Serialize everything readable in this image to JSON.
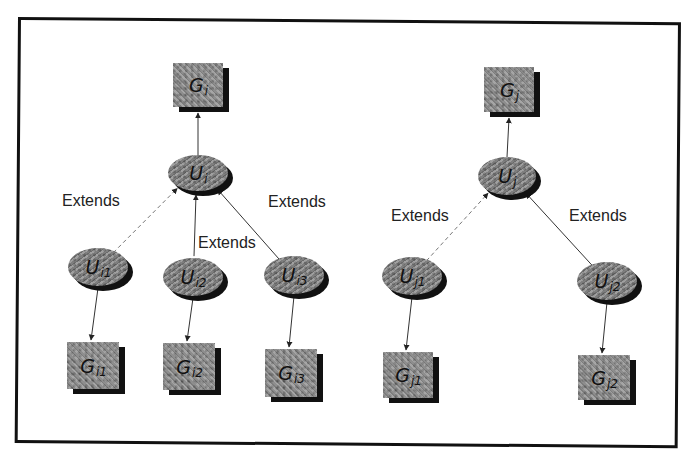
{
  "figure": {
    "frame": {
      "left": 18,
      "top": 17,
      "right": 683,
      "bottom": 446
    }
  },
  "trees": [
    {
      "id": "left",
      "group_root": {
        "label": "G",
        "sub": "i",
        "x": 173,
        "y": 63,
        "w": 50,
        "h": 44
      },
      "user_root": {
        "label": "U",
        "sub": "i",
        "cx": 198,
        "cy": 173,
        "rx": 30,
        "ry": 18
      },
      "children": [
        {
          "user": {
            "label": "U",
            "sub": "i1",
            "cx": 98,
            "cy": 267,
            "rx": 30,
            "ry": 19
          },
          "group": {
            "label": "G",
            "sub": "i1",
            "x": 67,
            "y": 342,
            "w": 52,
            "h": 47
          },
          "edge_style": "dashed"
        },
        {
          "user": {
            "label": "U",
            "sub": "i2",
            "cx": 193,
            "cy": 277,
            "rx": 30,
            "ry": 19
          },
          "group": {
            "label": "G",
            "sub": "i2",
            "x": 163,
            "y": 343,
            "w": 52,
            "h": 47
          },
          "edge_style": "solid"
        },
        {
          "user": {
            "label": "U",
            "sub": "i3",
            "cx": 294,
            "cy": 275,
            "rx": 30,
            "ry": 19
          },
          "group": {
            "label": "G",
            "sub": "i3",
            "x": 265,
            "y": 349,
            "w": 52,
            "h": 48
          },
          "edge_style": "solid"
        }
      ],
      "extends_labels": [
        {
          "text": "Extends",
          "x": 62,
          "y": 192
        },
        {
          "text": "Extends",
          "x": 268,
          "y": 193
        },
        {
          "text": "Extends",
          "x": 198,
          "y": 234
        }
      ]
    },
    {
      "id": "right",
      "group_root": {
        "label": "G",
        "sub": "j",
        "x": 484,
        "y": 67,
        "w": 50,
        "h": 45
      },
      "user_root": {
        "label": "U",
        "sub": "j",
        "cx": 507,
        "cy": 176,
        "rx": 29,
        "ry": 19
      },
      "children": [
        {
          "user": {
            "label": "U",
            "sub": "j1",
            "cx": 412,
            "cy": 276,
            "rx": 30,
            "ry": 19
          },
          "group": {
            "label": "G",
            "sub": "j1",
            "x": 383,
            "y": 352,
            "w": 50,
            "h": 46
          },
          "edge_style": "dashed"
        },
        {
          "user": {
            "label": "U",
            "sub": "j2",
            "cx": 607,
            "cy": 281,
            "rx": 30,
            "ry": 19
          },
          "group": {
            "label": "G",
            "sub": "j2",
            "x": 578,
            "y": 355,
            "w": 52,
            "h": 45
          },
          "edge_style": "solid"
        }
      ],
      "extends_labels": [
        {
          "text": "Extends",
          "x": 391,
          "y": 207
        },
        {
          "text": "Extends",
          "x": 569,
          "y": 207
        }
      ]
    }
  ],
  "legend": {
    "edge_label": "Extends"
  }
}
